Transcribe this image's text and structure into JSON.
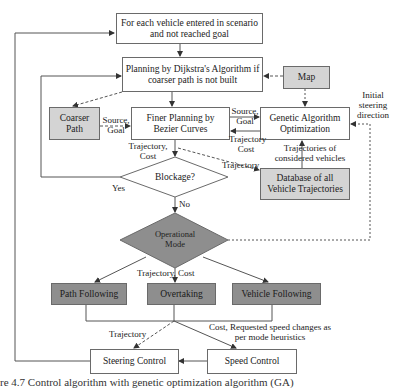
{
  "figure": {
    "caption": "re 4.7 Control algorithm with genetic optimization algorithm (GA)"
  },
  "nodes": {
    "start": "For each vehicle entered in scenario and not reached goal",
    "start_line1": "For each vehicle entered in scenario",
    "start_line2": "and not reached goal",
    "dijkstra_line1": "Planning by Dijkstra's Algorithm if",
    "dijkstra_line2": "coarser path is not built",
    "map": "Map",
    "coarser_line1": "Coarser",
    "coarser_line2": "Path",
    "finer_line1": "Finer Planning by",
    "finer_line2": "Bezier Curves",
    "ga_line1": "Genetic Algorithm",
    "ga_line2": "Optimization",
    "blockage": "Blockage?",
    "database_line1": "Database of all",
    "database_line2": "Vehicle Trajectories",
    "opmode_line1": "Operational",
    "opmode_line2": "Mode",
    "path_following": "Path Following",
    "overtaking": "Overtaking",
    "vehicle_following": "Vehicle Following",
    "steering_control": "Steering Control",
    "speed_control": "Speed Control"
  },
  "edge_labels": {
    "source_goal_1_line1": "Source,",
    "source_goal_1_line2": "Goal",
    "source_goal_2_line1": "Source,",
    "source_goal_2_line2": "Goal",
    "trajectory_cost_ga_line1": "Trajectory",
    "trajectory_cost_ga_line2": "Cost",
    "trajectory_cost_finer_line1": "Trajectory,",
    "trajectory_cost_finer_line2": "Cost",
    "trajectory_to_db": "Trajectory",
    "trajectories_considered_line1": "Trajectories of",
    "trajectories_considered_line2": "considered vehicles",
    "initial_steering_line1": "Initial",
    "initial_steering_line2": "steering",
    "initial_steering_line3": "direction",
    "yes": "Yes",
    "no": "No",
    "trajectory_cost_modes": "Trajectory, Cost",
    "trajectory_steering": "Trajectory",
    "cost_speed_line1": "Cost, Requested speed changes as",
    "cost_speed_line2": "per mode heuristics"
  },
  "colors": {
    "box_border": "#6a6a6a",
    "light_fill": "#d4d4d4",
    "dark_fill": "#8e8e8e",
    "line": "#555555"
  }
}
